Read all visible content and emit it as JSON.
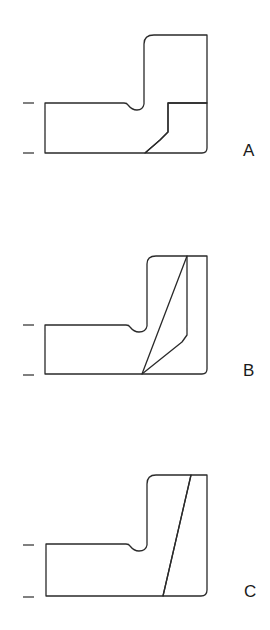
{
  "figure": {
    "type": "technical-cross-section",
    "hatch_color": "#2a2a2a",
    "background": "#ffffff",
    "views": [
      {
        "id": "A",
        "label": "A"
      },
      {
        "id": "B",
        "label": "B"
      },
      {
        "id": "C",
        "label": "C"
      }
    ]
  }
}
